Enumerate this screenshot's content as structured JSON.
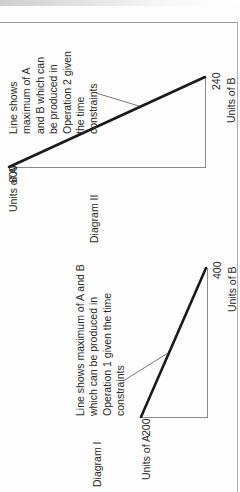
{
  "orientation": "rotated -90deg (text reads bottom-to-top)",
  "diagrams": [
    {
      "id": "diagram-2",
      "caption": "Diagram II",
      "y_axis_label": "Units of A",
      "y_intercept_label": "600",
      "x_axis_label": "Units of B",
      "x_intercept_label": "240",
      "annotation_lines": [
        "Line shows",
        "maximum of A",
        "and B which can",
        "be produced in",
        "Operation 2 given",
        "the time",
        "constraints"
      ]
    },
    {
      "id": "diagram-1",
      "caption": "Diagram I",
      "y_axis_label": "Units of A",
      "y_intercept_label": "200",
      "x_axis_label": "Units of B",
      "x_intercept_label": "400",
      "annotation_lines": [
        "Line shows maximum of A and B",
        "which can be produced in",
        "Operation 1 given the time",
        "constraints"
      ]
    }
  ],
  "colors": {
    "constraint_line": "#1a1a1a",
    "axis_line": "#8a8a8a",
    "frame": "#9a9a9a",
    "text": "#2a2a2a"
  }
}
